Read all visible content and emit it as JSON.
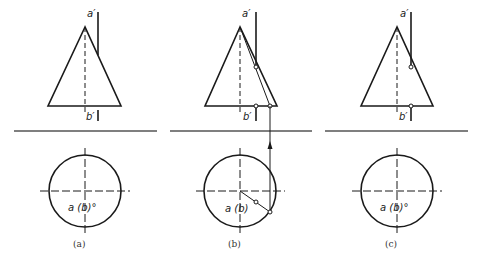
{
  "figure": {
    "line_color": "#1a1a1a",
    "baseline_color": "#555555",
    "panels": [
      {
        "id": "a",
        "caption": "(a)",
        "front_view": {
          "top_label": "a′",
          "bottom_label": "b′"
        },
        "top_view": {
          "point_label": "a (b)°"
        }
      },
      {
        "id": "b",
        "caption": "(b)",
        "front_view": {
          "top_label": "a′",
          "bottom_label": "b′"
        },
        "top_view": {
          "point_label": "a (b)"
        }
      },
      {
        "id": "c",
        "caption": "(c)",
        "front_view": {
          "top_label": "a′",
          "bottom_label": "b′"
        },
        "top_view": {
          "point_label": "a (b)°"
        }
      }
    ]
  }
}
